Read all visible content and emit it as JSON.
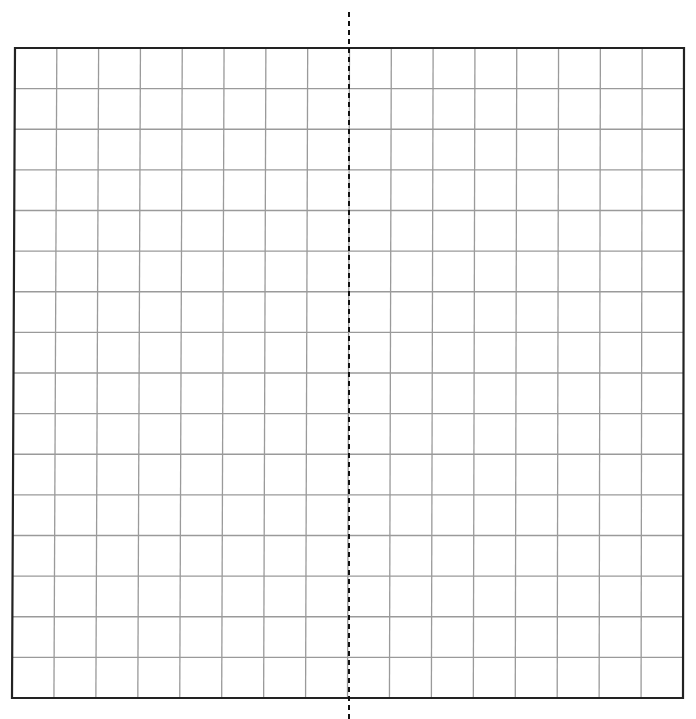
{
  "diagram": {
    "type": "grid-with-line-of-symmetry",
    "grid": {
      "columns": 16,
      "rows": 16,
      "corners": {
        "top_left": [
          15,
          48
        ],
        "top_right": [
          684,
          48
        ],
        "bottom_right": [
          683,
          698
        ],
        "bottom_left": [
          12,
          698
        ]
      },
      "border_color": "#222222",
      "border_width": 2.2,
      "line_color": "#9a9a9a",
      "line_width": 1.3
    },
    "symmetry_line": {
      "orientation": "vertical",
      "x": 349,
      "y_start": 12,
      "y_end": 719,
      "dash": [
        5,
        4
      ],
      "color": "#111111",
      "width": 2
    }
  }
}
